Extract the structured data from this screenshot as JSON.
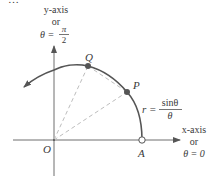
{
  "figure": {
    "type": "polar-curve-diagram",
    "top_cropped_text": "…",
    "y_axis": {
      "label_line1": "y-axis",
      "label_line2": "or",
      "theta_lhs": "θ =",
      "theta_num": "π",
      "theta_den": "2"
    },
    "x_axis": {
      "label_line1": "x-axis",
      "label_line2": "or",
      "label_line3": "θ = 0"
    },
    "points": {
      "origin": "O",
      "a": "A",
      "p": "P",
      "q": "Q"
    },
    "curve_equation": {
      "lhs": "r =",
      "numerator": "sinθ",
      "denominator": "θ"
    },
    "colors": {
      "axis": "#6e6e6e",
      "curve": "#555555",
      "dashed": "#bdbdbd",
      "point_fill": "#555555",
      "text": "#3a3a3a"
    }
  }
}
